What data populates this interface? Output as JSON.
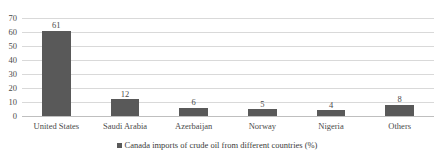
{
  "chart_data": {
    "type": "bar",
    "title": "",
    "xlabel": "",
    "ylabel": "",
    "ylim": [
      0,
      70
    ],
    "ytick_step": 10,
    "yticks": [
      70,
      60,
      50,
      40,
      30,
      20,
      10,
      0
    ],
    "grid": true,
    "legend_position": "bottom-center",
    "categories": [
      "United States",
      "Saudi Arabia",
      "Azerbaijan",
      "Norway",
      "Nigeria",
      "Others"
    ],
    "values": [
      61,
      12,
      6,
      5,
      4,
      8
    ],
    "data_labels": [
      "61",
      "12",
      "6",
      "5",
      "4",
      "8"
    ],
    "series": [
      {
        "name": "Canada imports of crude oil from different countries (%)",
        "values": [
          61,
          12,
          6,
          5,
          4,
          8
        ],
        "color": "#595959"
      }
    ]
  },
  "legend": {
    "swatch_icon": "square-swatch-icon",
    "label": "Canada imports of crude oil from different countries (%)",
    "color": "#595959"
  },
  "axes": {
    "y": {
      "ticks": [
        "70",
        "60",
        "50",
        "40",
        "30",
        "20",
        "10",
        "0"
      ],
      "min": 0,
      "max": 70
    },
    "x": {
      "ticks": [
        "United States",
        "Saudi Arabia",
        "Azerbaijan",
        "Norway",
        "Nigeria",
        "Others"
      ]
    }
  },
  "colors": {
    "bar": "#595959",
    "gridline": "#d9d9d9",
    "baseline": "#bfbfbf",
    "text": "#4a4a4a",
    "background": "#ffffff"
  },
  "title_remnant": ""
}
